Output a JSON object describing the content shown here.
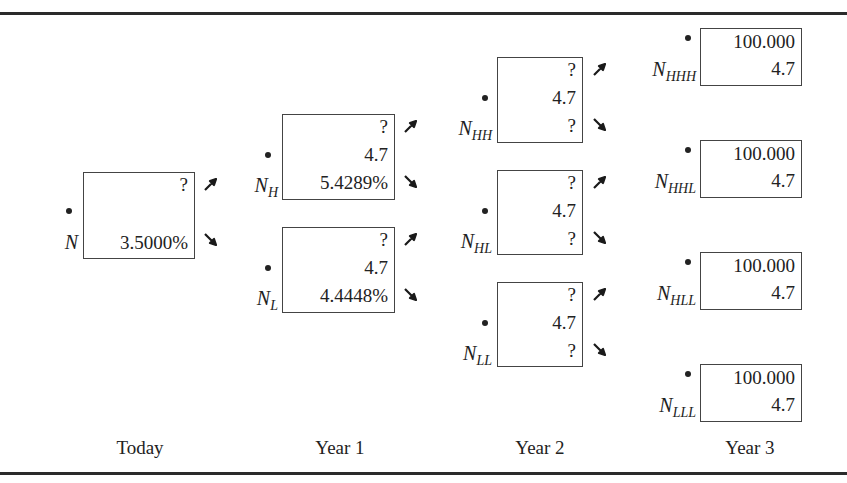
{
  "diagram": {
    "type": "binomial-interest-rate-tree",
    "periods": [
      "Today",
      "Year 1",
      "Year 2",
      "Year 3"
    ],
    "nodes": {
      "N": {
        "label_base": "N",
        "label_sub": "",
        "lines": [
          "?",
          "3.5000%"
        ]
      },
      "NH": {
        "label_base": "N",
        "label_sub": "H",
        "lines": [
          "?",
          "4.7",
          "5.4289%"
        ]
      },
      "NL": {
        "label_base": "N",
        "label_sub": "L",
        "lines": [
          "?",
          "4.7",
          "4.4448%"
        ]
      },
      "NHH": {
        "label_base": "N",
        "label_sub": "HH",
        "lines": [
          "?",
          "4.7",
          "?"
        ]
      },
      "NHL": {
        "label_base": "N",
        "label_sub": "HL",
        "lines": [
          "?",
          "4.7",
          "?"
        ]
      },
      "NLL": {
        "label_base": "N",
        "label_sub": "LL",
        "lines": [
          "?",
          "4.7",
          "?"
        ]
      },
      "NHHH": {
        "label_base": "N",
        "label_sub": "HHH",
        "lines": [
          "100.000",
          "4.7"
        ]
      },
      "NHHL": {
        "label_base": "N",
        "label_sub": "HHL",
        "lines": [
          "100.000",
          "4.7"
        ]
      },
      "NHLL": {
        "label_base": "N",
        "label_sub": "HLL",
        "lines": [
          "100.000",
          "4.7"
        ]
      },
      "NLLL": {
        "label_base": "N",
        "label_sub": "LLL",
        "lines": [
          "100.000",
          "4.7"
        ]
      }
    },
    "icons": {
      "up": "arrow-up-right-icon",
      "down": "arrow-down-right-icon"
    }
  }
}
